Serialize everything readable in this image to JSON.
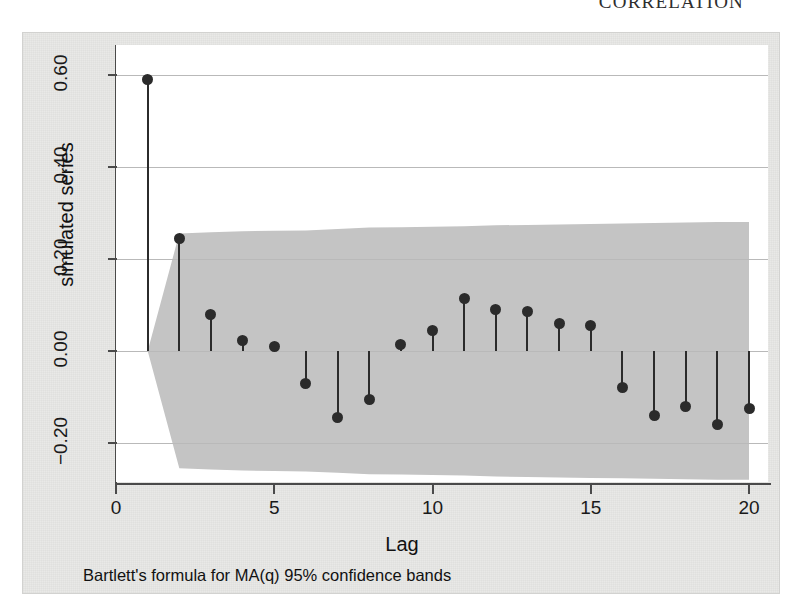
{
  "page": {
    "running_head": "CORRELATION"
  },
  "figure": {
    "caption": "Bartlett's formula for MA(q) 95% confidence bands"
  },
  "chart_data": {
    "type": "bar",
    "subtype": "correlogram-stem",
    "title": "",
    "xlabel": "Lag",
    "ylabel": "simulated series",
    "xlim": [
      0,
      20.6
    ],
    "ylim": [
      -0.285,
      0.665
    ],
    "xticks": [
      0,
      5,
      10,
      15,
      20
    ],
    "xtick_labels": [
      "0",
      "5",
      "10",
      "15",
      "20"
    ],
    "yticks": [
      -0.2,
      0.0,
      0.2,
      0.4,
      0.6
    ],
    "ytick_labels": [
      "-0.20",
      "0.00",
      "0.20",
      "0.40",
      "0.60"
    ],
    "grid": "horizontal",
    "legend": "none",
    "marker_color": "#2b2b2b",
    "band_color": "#c4c4c4",
    "categories": [
      1,
      2,
      3,
      4,
      5,
      6,
      7,
      8,
      9,
      10,
      11,
      12,
      13,
      14,
      15,
      16,
      17,
      18,
      19,
      20
    ],
    "values": [
      0.59,
      0.245,
      0.08,
      0.022,
      0.01,
      -0.07,
      -0.145,
      -0.105,
      0.015,
      0.045,
      0.115,
      0.09,
      0.085,
      0.06,
      0.055,
      -0.08,
      -0.14,
      -0.12,
      -0.16,
      -0.125
    ],
    "confidence_band": {
      "label": "Bartlett's formula for MA(q) 95% confidence bands",
      "level": "95%",
      "upper": [
        0.255,
        0.255,
        0.258,
        0.26,
        0.261,
        0.262,
        0.265,
        0.268,
        0.269,
        0.27,
        0.271,
        0.273,
        0.274,
        0.275,
        0.276,
        0.277,
        0.278,
        0.279,
        0.28,
        0.28
      ],
      "lower": [
        -0.255,
        -0.255,
        -0.258,
        -0.26,
        -0.261,
        -0.262,
        -0.265,
        -0.268,
        -0.269,
        -0.27,
        -0.271,
        -0.273,
        -0.274,
        -0.275,
        -0.276,
        -0.277,
        -0.278,
        -0.279,
        -0.28,
        -0.28
      ],
      "starts_at_lag": 1
    }
  }
}
